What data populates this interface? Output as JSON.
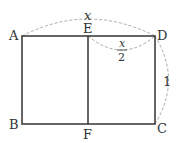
{
  "diagram": {
    "type": "geometry-rectangle",
    "points": {
      "A": {
        "label": "A",
        "x": 22,
        "y": 36
      },
      "D": {
        "label": "D",
        "x": 155,
        "y": 36
      },
      "B": {
        "label": "B",
        "x": 22,
        "y": 124
      },
      "C": {
        "label": "C",
        "x": 155,
        "y": 124
      },
      "E": {
        "label": "E",
        "x": 88,
        "y": 36
      },
      "F": {
        "label": "F",
        "x": 88,
        "y": 124
      }
    },
    "measures": {
      "AD": {
        "label": "x"
      },
      "ED_numerator": {
        "label": "x"
      },
      "ED_denominator": {
        "label": "2"
      },
      "DC": {
        "label": "1"
      }
    },
    "colors": {
      "line": "#333333",
      "dashed": "#aaaaaa",
      "text": "#333333"
    }
  }
}
